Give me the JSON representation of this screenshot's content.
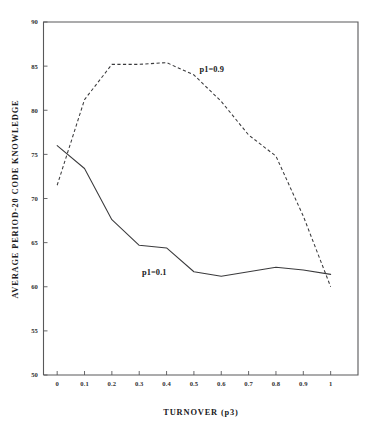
{
  "chart_data": {
    "type": "line",
    "title": "",
    "xlabel": "TURNOVER (p3)",
    "ylabel": "AVERAGE PERIOD-20 CODE KNOWLEDGE",
    "xlim": [
      -0.05,
      1.1
    ],
    "ylim": [
      50,
      90
    ],
    "grid": false,
    "legend_position": "inline-annotation",
    "x_ticks": [
      0,
      0.1,
      0.2,
      0.3,
      0.4,
      0.5,
      0.6,
      0.7,
      0.8,
      0.9,
      1
    ],
    "x_tick_labels": [
      "0",
      "0.1",
      "0.2",
      "0.3",
      "0.4",
      "0.5",
      "0.6",
      "0.7",
      "0.8",
      "0.9",
      "1"
    ],
    "y_ticks": [
      50,
      55,
      60,
      65,
      70,
      75,
      80,
      85,
      90
    ],
    "y_tick_labels": [
      "50",
      "55",
      "60",
      "65",
      "70",
      "75",
      "80",
      "85",
      "90"
    ],
    "x": [
      0,
      0.1,
      0.2,
      0.3,
      0.4,
      0.5,
      0.6,
      0.7,
      0.8,
      0.9,
      1
    ],
    "series": [
      {
        "name": "p1=0.9",
        "style": "dashed",
        "label_x": 0.52,
        "label_y": 84.3,
        "values": [
          71.5,
          81.2,
          85.2,
          85.2,
          85.4,
          84.0,
          81.0,
          77.2,
          74.8,
          68.0,
          60.0
        ]
      },
      {
        "name": "p1=0.1",
        "style": "solid",
        "label_x": 0.31,
        "label_y": 61.3,
        "values": [
          76.0,
          73.4,
          67.6,
          64.7,
          64.4,
          61.7,
          61.2,
          61.7,
          62.2,
          61.9,
          61.4
        ]
      }
    ],
    "annotations": [
      {
        "text": "p1=0.9",
        "x": 0.52,
        "y": 84.3
      },
      {
        "text": "p1=0.1",
        "x": 0.31,
        "y": 61.3
      }
    ]
  }
}
